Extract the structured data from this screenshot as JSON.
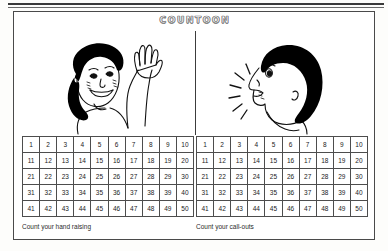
{
  "worksheet": {
    "title": "COUNTOON",
    "panels": [
      {
        "id": "hand-raising",
        "figure": "child-raising-hand",
        "caption": "Count your hand raising",
        "grid": {
          "rows": 5,
          "columns": 10,
          "numbers": [
            1,
            2,
            3,
            4,
            5,
            6,
            7,
            8,
            9,
            10,
            11,
            12,
            13,
            14,
            15,
            16,
            17,
            18,
            19,
            20,
            21,
            22,
            23,
            24,
            25,
            26,
            27,
            28,
            29,
            30,
            31,
            32,
            33,
            34,
            35,
            36,
            37,
            38,
            39,
            40,
            41,
            42,
            43,
            44,
            45,
            46,
            47,
            48,
            49,
            50
          ]
        }
      },
      {
        "id": "call-outs",
        "figure": "child-calling-out",
        "caption": "Count your call-outs",
        "grid": {
          "rows": 5,
          "columns": 10,
          "numbers": [
            1,
            2,
            3,
            4,
            5,
            6,
            7,
            8,
            9,
            10,
            11,
            12,
            13,
            14,
            15,
            16,
            17,
            18,
            19,
            20,
            21,
            22,
            23,
            24,
            25,
            26,
            27,
            28,
            29,
            30,
            31,
            32,
            33,
            34,
            35,
            36,
            37,
            38,
            39,
            40,
            41,
            42,
            43,
            44,
            45,
            46,
            47,
            48,
            49,
            50
          ]
        }
      }
    ]
  },
  "colors": {
    "ink": "#1a1a1a",
    "rule": "#4d4d4d",
    "paper": "#ffffff",
    "hair": "#000000"
  }
}
